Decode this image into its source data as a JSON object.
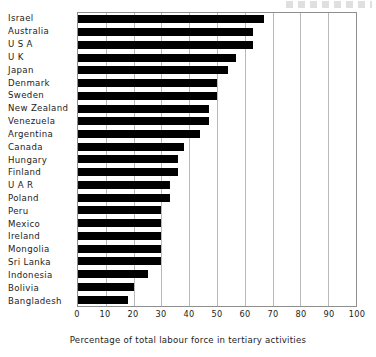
{
  "chart_data": {
    "type": "bar",
    "orientation": "horizontal",
    "title": "",
    "xlabel": "Percentage of total labour force in tertiary activities",
    "ylabel": "",
    "xlim": [
      0,
      100
    ],
    "xticks": [
      0,
      10,
      20,
      30,
      40,
      50,
      60,
      70,
      80,
      90,
      100
    ],
    "xtick_labels": [
      "0",
      "10",
      "20",
      "30",
      "40",
      "50",
      "60",
      "70",
      "80",
      "90",
      "100"
    ],
    "grid": true,
    "grid_axis": "x",
    "legend": false,
    "bar_color": "#000000",
    "categories": [
      "Israel",
      "Australia",
      "U S A",
      "U K",
      "Japan",
      "Denmark",
      "Sweden",
      "New Zealand",
      "Venezuela",
      "Argentina",
      "Canada",
      "Hungary",
      "Finland",
      "U A R",
      "Poland",
      "Peru",
      "Mexico",
      "Ireland",
      "Mongolia",
      "Sri Lanka",
      "Indonesia",
      "Bolivia",
      "Bangladesh"
    ],
    "values": [
      67,
      63,
      63,
      57,
      54,
      50,
      50,
      47,
      47,
      44,
      38,
      36,
      36,
      33,
      33,
      30,
      30,
      30,
      30,
      30,
      25,
      20,
      18
    ]
  }
}
